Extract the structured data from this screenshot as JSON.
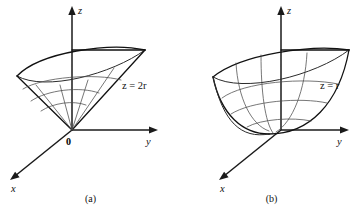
{
  "figure": {
    "panels": [
      {
        "id": "a",
        "caption": "(a)",
        "surface_label": "z = 2r",
        "surface_type": "cone",
        "axes": {
          "x_label": "x",
          "y_label": "y",
          "z_label": "z",
          "origin_label": "0"
        }
      },
      {
        "id": "b",
        "caption": "(b)",
        "surface_label": "z = r",
        "surface_type": "paraboloid",
        "axes": {
          "x_label": "x",
          "y_label": "y",
          "z_label": "z",
          "origin_label": ""
        }
      }
    ]
  },
  "colors": {
    "ink": "#111111",
    "axis": "#1a1a1a",
    "grid": "#4a4a4a",
    "background": "#ffffff"
  }
}
